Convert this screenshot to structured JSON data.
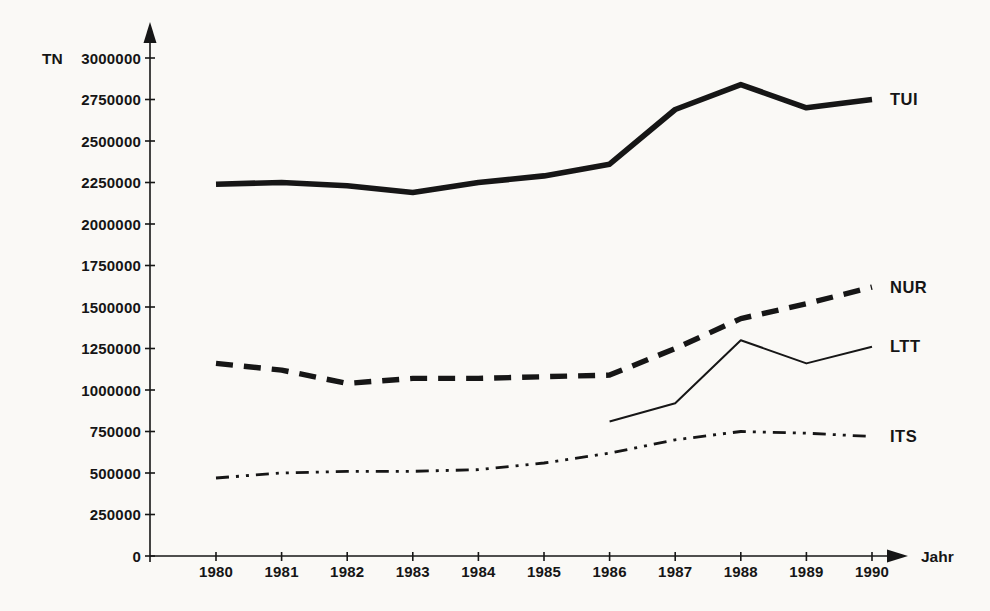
{
  "figure": {
    "background": "#faf9f6",
    "ink_color": "#161616"
  },
  "chart_data": {
    "type": "line",
    "title": "",
    "xlabel": "Jahr",
    "ylabel": "TN",
    "x": [
      1980,
      1981,
      1982,
      1983,
      1984,
      1985,
      1986,
      1987,
      1988,
      1989,
      1990
    ],
    "ylim": [
      0,
      3000000
    ],
    "yticks": [
      0,
      250000,
      500000,
      750000,
      1000000,
      1250000,
      1500000,
      1750000,
      2000000,
      2250000,
      2500000,
      2750000,
      3000000
    ],
    "grid": false,
    "legend_position": "right-of-line-ends",
    "series": [
      {
        "name": "TUI",
        "style": "solid-thick",
        "values": [
          2240000,
          2250000,
          2230000,
          2190000,
          2250000,
          2290000,
          2360000,
          2690000,
          2840000,
          2700000,
          2750000
        ]
      },
      {
        "name": "NUR",
        "style": "dashed-thick",
        "values": [
          1160000,
          1120000,
          1040000,
          1070000,
          1070000,
          1080000,
          1090000,
          1250000,
          1430000,
          1520000,
          1620000
        ]
      },
      {
        "name": "LTT",
        "style": "solid-thin",
        "values": [
          null,
          null,
          null,
          null,
          null,
          null,
          810000,
          920000,
          1300000,
          1160000,
          1260000
        ]
      },
      {
        "name": "ITS",
        "style": "dash-dot-dot",
        "values": [
          470000,
          500000,
          510000,
          510000,
          520000,
          560000,
          620000,
          700000,
          750000,
          740000,
          720000
        ]
      }
    ]
  }
}
